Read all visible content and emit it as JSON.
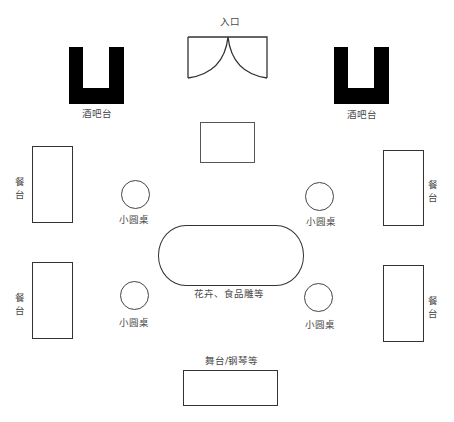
{
  "entrance": {
    "label": "入口"
  },
  "bars": [
    {
      "label": "酒吧台"
    },
    {
      "label": "酒吧台"
    }
  ],
  "buffets": [
    {
      "label": "餐台"
    },
    {
      "label": "餐台"
    },
    {
      "label": "餐台"
    },
    {
      "label": "餐台"
    }
  ],
  "round_tables": [
    {
      "label": "小圆桌"
    },
    {
      "label": "小圆桌"
    },
    {
      "label": "小圆桌"
    },
    {
      "label": "小圆桌"
    }
  ],
  "centerpiece": {
    "label": "花卉、食品雕等"
  },
  "stage": {
    "label": "舞台/钢琴等"
  }
}
